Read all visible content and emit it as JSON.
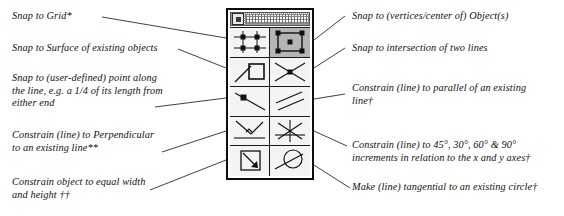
{
  "figure": {
    "type": "annotated-ui-diagram"
  },
  "palette": {
    "name": "snap-constrain-palette",
    "titlebar": {
      "icon": "window-box-icon",
      "grip": "drag-grip"
    },
    "tools": [
      {
        "id": "snap-to-grid",
        "icon": "grid-dots-icon",
        "row": 1,
        "col": 1,
        "pressed": false
      },
      {
        "id": "snap-to-object",
        "icon": "object-vertices-icon",
        "row": 1,
        "col": 2,
        "pressed": true
      },
      {
        "id": "snap-to-surface",
        "icon": "line-to-square-icon",
        "row": 2,
        "col": 1,
        "pressed": false
      },
      {
        "id": "snap-to-intersection",
        "icon": "crossing-lines-icon",
        "row": 2,
        "col": 2,
        "pressed": false
      },
      {
        "id": "snap-to-point-on-line",
        "icon": "point-on-line-icon",
        "row": 3,
        "col": 1,
        "pressed": false
      },
      {
        "id": "constrain-parallel",
        "icon": "parallel-lines-icon",
        "row": 3,
        "col": 2,
        "pressed": false
      },
      {
        "id": "constrain-perpendicular",
        "icon": "perpendicular-icon",
        "row": 4,
        "col": 1,
        "pressed": false
      },
      {
        "id": "constrain-angle",
        "icon": "angle-increments-icon",
        "row": 4,
        "col": 2,
        "pressed": false
      },
      {
        "id": "constrain-equal-wh",
        "icon": "square-diagonal-icon",
        "row": 5,
        "col": 1,
        "pressed": false
      },
      {
        "id": "constrain-tangent",
        "icon": "circle-tangent-icon",
        "row": 5,
        "col": 2,
        "pressed": false
      }
    ]
  },
  "callouts": {
    "left": [
      {
        "id": "callout-snap-to-grid",
        "text": "Snap to Grid*"
      },
      {
        "id": "callout-snap-to-surface",
        "text": "Snap to Surface of existing objects"
      },
      {
        "id": "callout-snap-to-point-on-line",
        "text": "Snap to (user-defined) point along\nthe line, e.g. a 1/4 of its length from\neither end"
      },
      {
        "id": "callout-constrain-perpendicular",
        "text": "Constrain (line) to Perpendicular\nto an existing line**"
      },
      {
        "id": "callout-constrain-equal-wh",
        "text": "Constrain object  to equal width\nand height ††"
      }
    ],
    "right": [
      {
        "id": "callout-snap-to-object",
        "text": "Snap to (vertices/center of) Object(s)"
      },
      {
        "id": "callout-snap-to-intersection",
        "text": "Snap to intersection of two lines"
      },
      {
        "id": "callout-constrain-parallel",
        "text": "Constrain (line) to parallel of an existing\nline†"
      },
      {
        "id": "callout-constrain-angle",
        "text": "Constrain (line) to 45°, 30°, 60° & 90°\nincrements in relation to the x and y axes†"
      },
      {
        "id": "callout-constrain-tangent",
        "text": "Make (line) tangential to an existing circle†"
      }
    ]
  },
  "colors": {
    "ink": "#111111",
    "border": "#0d0d0d",
    "cell_bg": "#f4f4f4",
    "cell_pressed_bg": "#b5b5b5",
    "leader": "#2a2a2a"
  }
}
